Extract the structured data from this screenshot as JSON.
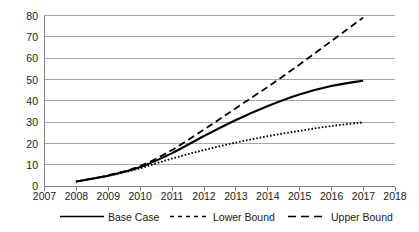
{
  "chart_data": {
    "type": "line",
    "title": "",
    "xlabel": "",
    "ylabel": "",
    "xlim": [
      2007,
      2018
    ],
    "ylim": [
      0,
      80
    ],
    "grid": true,
    "legend_position": "bottom",
    "x_ticks": [
      "2007",
      "2008",
      "2009",
      "2010",
      "2011",
      "2012",
      "2013",
      "2014",
      "2015",
      "2016",
      "2017",
      "2018"
    ],
    "y_ticks": [
      "0",
      "10",
      "20",
      "30",
      "40",
      "50",
      "60",
      "70",
      "80"
    ],
    "x": [
      2008,
      2009,
      2010,
      2011,
      2012,
      2013,
      2014,
      2015,
      2016,
      2017
    ],
    "series": [
      {
        "name": "Base Case",
        "style": "solid",
        "color": "#000000",
        "values": [
          2.3,
          5.0,
          9.0,
          15.5,
          23.5,
          31.0,
          37.5,
          43.0,
          47.0,
          49.5
        ]
      },
      {
        "name": "Lower Bound",
        "style": "dotted",
        "color": "#000000",
        "values": [
          2.3,
          5.0,
          8.5,
          13.0,
          17.0,
          20.5,
          23.5,
          26.0,
          28.3,
          30.0
        ]
      },
      {
        "name": "Upper Bound",
        "style": "dashed",
        "color": "#000000",
        "values": [
          2.3,
          5.2,
          9.5,
          17.0,
          26.5,
          36.5,
          46.5,
          57.0,
          68.0,
          79.0
        ]
      }
    ]
  },
  "legend": {
    "items": [
      {
        "label": "Base Case",
        "swatch": "solid-line-swatch"
      },
      {
        "label": "Lower Bound",
        "swatch": "short-dashed-line-swatch"
      },
      {
        "label": "Upper Bound",
        "swatch": "long-dashed-line-swatch"
      }
    ]
  },
  "axes": {
    "y_tick_labels": [
      "80",
      "70",
      "60",
      "50",
      "40",
      "30",
      "20",
      "10",
      "0"
    ],
    "x_tick_labels": [
      "2007",
      "2008",
      "2009",
      "2010",
      "2011",
      "2012",
      "2013",
      "2014",
      "2015",
      "2016",
      "2017",
      "2018"
    ]
  },
  "colors": {
    "gridline": "#a6a6a6",
    "axis": "#7f7f7f",
    "series": "#000000",
    "background": "#ffffff",
    "text": "#1a1a1a"
  }
}
